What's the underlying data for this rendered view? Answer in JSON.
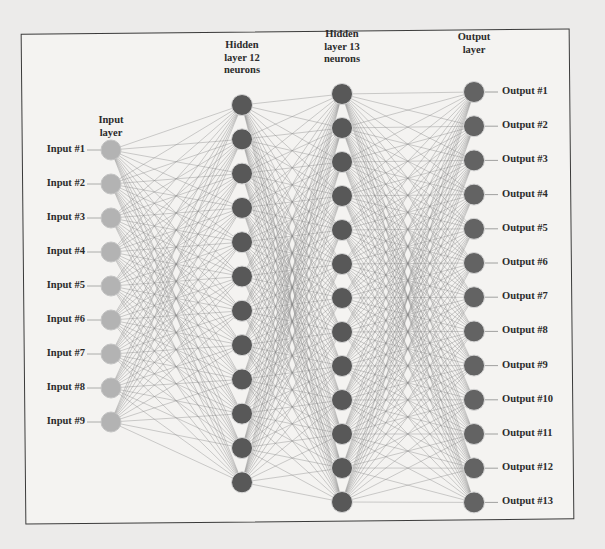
{
  "diagram": {
    "type": "neural-network",
    "colors": {
      "input_node": "#b3b3b3",
      "hidden_node": "#585858",
      "output_node": "#636363",
      "edge": "#8a8a8a",
      "frame": "#3a3a3a",
      "text": "#2b2b2b"
    },
    "layers": [
      {
        "id": "input",
        "title_lines": [
          "Input",
          "layer"
        ],
        "neurons": 9,
        "x": 111,
        "y_start": 150,
        "y_step": 34,
        "title_y": 128,
        "labels": [
          "Input #1",
          "Input #2",
          "Input #3",
          "Input #4",
          "Input #5",
          "Input #6",
          "Input #7",
          "Input #8",
          "Input #9"
        ]
      },
      {
        "id": "hidden1",
        "title_lines": [
          "Hidden",
          "layer 12",
          "neurons"
        ],
        "neurons": 12,
        "x": 242,
        "y_start": 105,
        "y_step": 34.3,
        "title_y": 53,
        "labels": []
      },
      {
        "id": "hidden2",
        "title_lines": [
          "Hidden",
          "layer 13",
          "neurons"
        ],
        "neurons": 13,
        "x": 342,
        "y_start": 94,
        "y_step": 34.0,
        "title_y": 42,
        "labels": []
      },
      {
        "id": "output",
        "title_lines": [
          "Output",
          "layer"
        ],
        "neurons": 13,
        "x": 474,
        "y_start": 92,
        "y_step": 34.2,
        "title_y": 45,
        "labels": [
          "Output #1",
          "Output #2",
          "Output #3",
          "Output #4",
          "Output #5",
          "Output #6",
          "Output #7",
          "Output #8",
          "Output #9",
          "Output #10",
          "Output #11",
          "Output #12",
          "Output #13"
        ]
      }
    ],
    "connections": "fully-connected"
  }
}
